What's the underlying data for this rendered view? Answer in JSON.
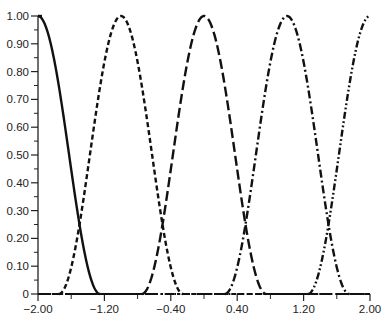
{
  "chart_data": {
    "type": "line",
    "title": "",
    "xlabel": "",
    "ylabel": "",
    "xlim": [
      -2.0,
      2.0
    ],
    "ylim": [
      0,
      1.0
    ],
    "grid": false,
    "legend": null,
    "x_ticks": [
      -2.0,
      -1.2,
      -0.4,
      0.4,
      1.2,
      2.0
    ],
    "x_tick_labels": [
      "−2.00",
      "−1.20",
      "−0.40",
      "0.40",
      "1.20",
      "2.00"
    ],
    "x_minor_ticks": [
      -1.6,
      -0.8,
      0.0,
      0.8,
      1.6
    ],
    "y_ticks": [
      0,
      0.1,
      0.2,
      0.3,
      0.4,
      0.5,
      0.6,
      0.7,
      0.8,
      0.9,
      1.0
    ],
    "y_tick_labels": [
      "0",
      "0.10",
      "0.20",
      "0.30",
      "0.40",
      "0.50",
      "0.60",
      "0.70",
      "0.80",
      "0.90",
      "1.00"
    ],
    "series": [
      {
        "name": "curve-1",
        "center": -2.0,
        "half_width": 0.75,
        "style": "solid",
        "color": "#111111",
        "x": [
          -2.0,
          -1.9,
          -1.8,
          -1.7,
          -1.6,
          -1.5,
          -1.4,
          -1.3,
          -1.25
        ],
        "y": [
          1.0,
          0.96,
          0.85,
          0.69,
          0.5,
          0.25,
          0.11,
          0.03,
          0.0
        ]
      },
      {
        "name": "curve-2",
        "center": -1.0,
        "half_width": 0.75,
        "style": "short-dash",
        "color": "#111111",
        "x": [
          -1.75,
          -1.5,
          -1.25,
          -1.0,
          -0.75,
          -0.5,
          -0.25
        ],
        "y": [
          0.0,
          0.25,
          0.75,
          1.0,
          0.75,
          0.25,
          0.0
        ]
      },
      {
        "name": "curve-3",
        "center": 0.0,
        "half_width": 0.75,
        "style": "long-dash",
        "color": "#111111",
        "x": [
          -0.75,
          -0.5,
          -0.25,
          0.0,
          0.25,
          0.5,
          0.75
        ],
        "y": [
          0.0,
          0.25,
          0.75,
          1.0,
          0.75,
          0.25,
          0.0
        ]
      },
      {
        "name": "curve-4",
        "center": 1.0,
        "half_width": 0.75,
        "style": "dash-dot",
        "color": "#111111",
        "x": [
          0.25,
          0.5,
          0.75,
          1.0,
          1.25,
          1.5,
          1.75
        ],
        "y": [
          0.0,
          0.25,
          0.75,
          1.0,
          0.75,
          0.25,
          0.0
        ]
      },
      {
        "name": "curve-5",
        "center": 2.0,
        "half_width": 0.75,
        "style": "dash-dot-dot",
        "color": "#111111",
        "x": [
          1.25,
          1.5,
          1.75,
          2.0
        ],
        "y": [
          0.0,
          0.25,
          0.75,
          1.0
        ]
      }
    ]
  },
  "layout": {
    "plot_left": 38,
    "plot_right": 370,
    "plot_top": 16,
    "plot_bottom": 294
  }
}
